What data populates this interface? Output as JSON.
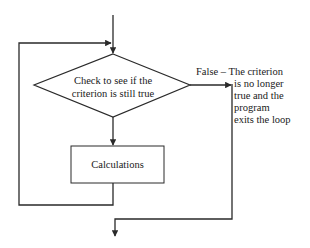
{
  "diagram": {
    "type": "flowchart",
    "colors": {
      "background": "#ffffff",
      "stroke": "#2a2a2a",
      "text": "#1a1a1a"
    },
    "nodes": {
      "decision": {
        "shape": "diamond",
        "lines": [
          "Check to see if the",
          "criterion is still true"
        ]
      },
      "process": {
        "shape": "rectangle",
        "label": "Calculations"
      }
    },
    "edges": {
      "false_branch": {
        "lines": [
          "False – The criterion",
          "is no longer",
          "true and the",
          "program",
          "exits the loop"
        ]
      }
    }
  }
}
